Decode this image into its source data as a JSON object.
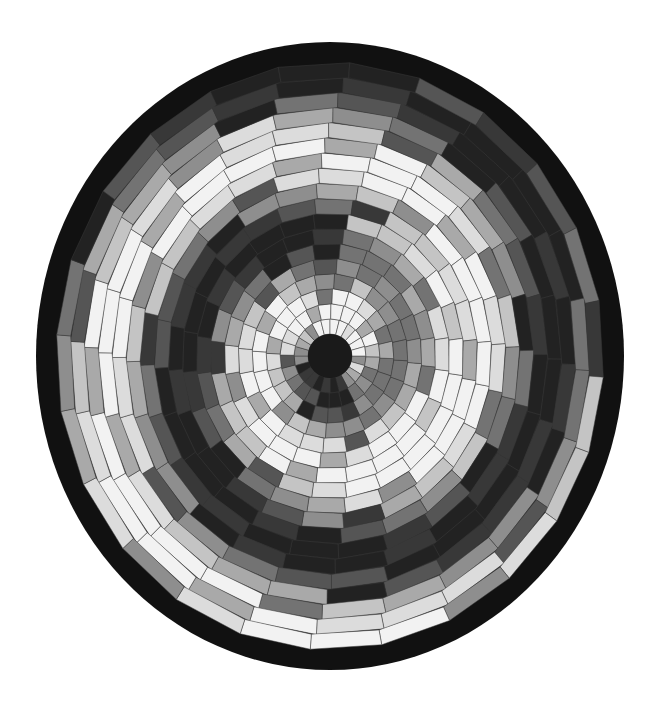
{
  "image": {
    "subject": "Circular spiral quilt (grayscale photograph)",
    "width": 657,
    "height": 711,
    "background": "#ffffff"
  },
  "quilt": {
    "center": [
      330,
      356
    ],
    "radius_x": 294,
    "radius_y": 314,
    "binding_color": "#111111",
    "binding_width": 20,
    "center_disk_color": "#1a1a1a",
    "center_disk_radius": 22,
    "sectors": 24,
    "rings": 18,
    "seam_color": "#3a3a3a",
    "twist_per_ring_deg": 15,
    "palette": [
      "#f2f2f2",
      "#dcdcdc",
      "#c4c4c4",
      "#a9a9a9",
      "#8e8e8e",
      "#737373",
      "#555555",
      "#383838",
      "#222222"
    ]
  }
}
